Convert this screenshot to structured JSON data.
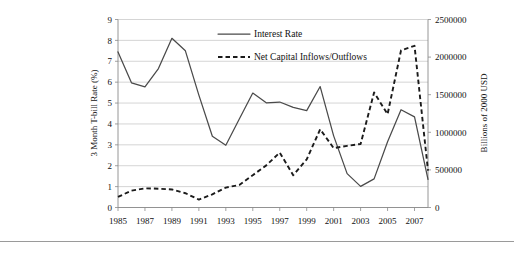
{
  "chart_data": {
    "type": "line",
    "title": "",
    "xlabel": "",
    "ylabel": "3 Month T-bill Rate (%)",
    "y2label": "Billions of 2000 USD",
    "grid": true,
    "legend_position": "top-center",
    "x": [
      1985,
      1986,
      1987,
      1988,
      1989,
      1990,
      1991,
      1992,
      1993,
      1994,
      1995,
      1996,
      1997,
      1998,
      1999,
      2000,
      2001,
      2002,
      2003,
      2004,
      2005,
      2006,
      2007,
      2008
    ],
    "xticks": [
      "1985",
      "1987",
      "1989",
      "1991",
      "1993",
      "1995",
      "1997",
      "1999",
      "2001",
      "2003",
      "2005",
      "2007"
    ],
    "xtick_values": [
      1985,
      1987,
      1989,
      1991,
      1993,
      1995,
      1997,
      1999,
      2001,
      2003,
      2005,
      2007
    ],
    "xlim": [
      1985,
      2008
    ],
    "yticks": [
      "0",
      "1",
      "2",
      "3",
      "4",
      "5",
      "6",
      "7",
      "8",
      "9"
    ],
    "ytick_values": [
      0,
      1,
      2,
      3,
      4,
      5,
      6,
      7,
      8,
      9
    ],
    "ylim": [
      0,
      9
    ],
    "y2ticks": [
      "0",
      "500000",
      "1000000",
      "1500000",
      "2000000",
      "2500000"
    ],
    "y2tick_values": [
      0,
      500000,
      1000000,
      1500000,
      2000000,
      2500000
    ],
    "y2lim": [
      0,
      2500000
    ],
    "series": [
      {
        "name": "Interest Rate",
        "axis": "left",
        "style": "solid",
        "color": "#4a4a4a",
        "values": [
          7.45,
          5.97,
          5.77,
          6.65,
          8.1,
          7.5,
          5.38,
          3.41,
          2.98,
          4.24,
          5.48,
          5.01,
          5.05,
          4.79,
          4.64,
          5.79,
          3.43,
          1.62,
          1.01,
          1.37,
          3.15,
          4.68,
          4.34,
          1.35
        ]
      },
      {
        "name": "Net Capital Inflows/Outflows",
        "axis": "right",
        "style": "dashed",
        "color": "#1b1b1b",
        "values": [
          140000,
          225000,
          255000,
          250000,
          240000,
          190000,
          105000,
          175000,
          265000,
          300000,
          430000,
          560000,
          730000,
          430000,
          640000,
          1040000,
          790000,
          820000,
          845000,
          1530000,
          1240000,
          2090000,
          2150000,
          490000
        ]
      }
    ]
  },
  "legend": {
    "items": [
      {
        "label": "Interest Rate",
        "style": "solid"
      },
      {
        "label": "Net Capital Inflows/Outflows",
        "style": "dashed"
      }
    ]
  }
}
